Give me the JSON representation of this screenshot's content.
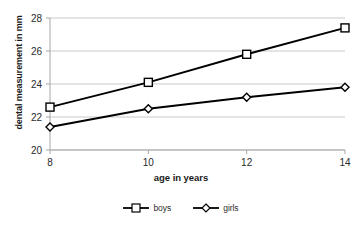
{
  "chart_data": {
    "type": "line",
    "title": "",
    "subtitle": "",
    "xlabel": "age in years",
    "ylabel": "dental measurement in mm",
    "x": [
      8,
      10,
      12,
      14
    ],
    "categories": [
      "8",
      "10",
      "12",
      "14"
    ],
    "xticklabels": [
      "8",
      "10",
      "12",
      "14"
    ],
    "yticklabels": [
      "20",
      "22",
      "24",
      "26",
      "28"
    ],
    "yticks": [
      20,
      22,
      24,
      26,
      28
    ],
    "xlim": [
      8,
      14
    ],
    "ylim": [
      20,
      28
    ],
    "grid": "horizontal",
    "legend_position": "bottom-center",
    "series": [
      {
        "name": "boys",
        "marker": "open-square",
        "color": "#000000",
        "values": [
          22.6,
          24.1,
          25.8,
          27.4
        ]
      },
      {
        "name": "girls",
        "marker": "open-diamond",
        "color": "#000000",
        "values": [
          21.4,
          22.5,
          23.2,
          23.8
        ]
      }
    ]
  },
  "axes": {
    "y_title": "dental measurement in mm",
    "x_title": "age in years"
  },
  "legend": {
    "items": [
      {
        "label": "boys",
        "marker": "square-marker"
      },
      {
        "label": "girls",
        "marker": "diamond-marker"
      }
    ]
  },
  "colors": {
    "line": "#000000",
    "grid": "#c9c9c9",
    "axis": "#a6a6a6",
    "text": "#2b2b2b",
    "background": "#ffffff"
  }
}
